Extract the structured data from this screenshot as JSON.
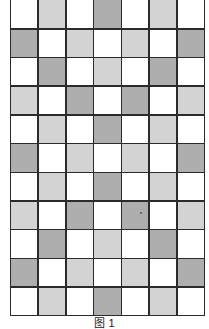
{
  "figure": {
    "caption": "图 1",
    "colors": {
      "W": "#ffffff",
      "L": "#d3d3d3",
      "D": "#aeaeae",
      "line": "#2b2b2b"
    },
    "columns": 7,
    "rows": 11,
    "grid": [
      [
        "W",
        "L",
        "W",
        "D",
        "W",
        "L",
        "W"
      ],
      [
        "D",
        "W",
        "L",
        "W",
        "L",
        "W",
        "D"
      ],
      [
        "W",
        "D",
        "W",
        "L",
        "W",
        "D",
        "W"
      ],
      [
        "L",
        "W",
        "D",
        "W",
        "D",
        "W",
        "L"
      ],
      [
        "W",
        "L",
        "W",
        "D",
        "W",
        "L",
        "W"
      ],
      [
        "D",
        "W",
        "L",
        "W",
        "L",
        "W",
        "D"
      ],
      [
        "W",
        "L",
        "W",
        "D",
        "W",
        "L",
        "W"
      ],
      [
        "L",
        "W",
        "D",
        "W",
        "D",
        "W",
        "L"
      ],
      [
        "W",
        "D",
        "W",
        "L",
        "W",
        "D",
        "W"
      ],
      [
        "D",
        "W",
        "L",
        "W",
        "L",
        "W",
        "D"
      ],
      [
        "W",
        "L",
        "W",
        "D",
        "W",
        "L",
        "W"
      ]
    ],
    "marks": [
      {
        "row": 7,
        "col": 4,
        "type": "dot"
      }
    ]
  }
}
